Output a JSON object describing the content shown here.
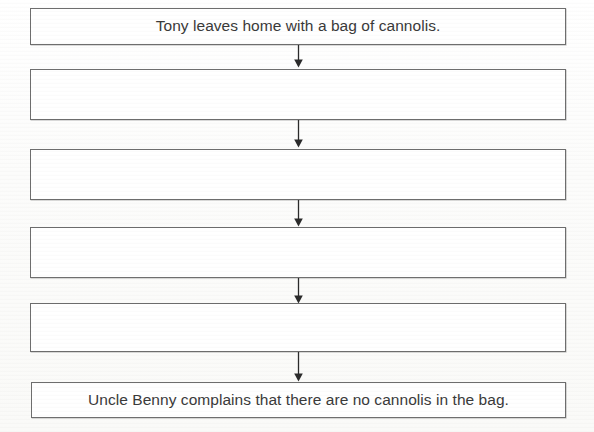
{
  "worksheet": {
    "type": "sequence-flowchart",
    "orientation": "vertical",
    "arrow_count": 5,
    "boxes": [
      {
        "index": 1,
        "text": "Tony leaves home with a bag of cannolis.",
        "filled": true
      },
      {
        "index": 2,
        "text": "",
        "filled": false
      },
      {
        "index": 3,
        "text": "",
        "filled": false
      },
      {
        "index": 4,
        "text": "",
        "filled": false
      },
      {
        "index": 5,
        "text": "",
        "filled": false
      },
      {
        "index": 6,
        "text": "Uncle Benny complains that there are no cannolis in the bag.",
        "filled": true
      }
    ],
    "colors": {
      "page_background": "#fdfdfc",
      "box_fill": "#ffffff",
      "box_border": "#6e6e6e",
      "text": "#3a3a3a",
      "arrow": "#2b2b2b"
    },
    "icons": {
      "connector": "down-arrow-icon"
    }
  }
}
